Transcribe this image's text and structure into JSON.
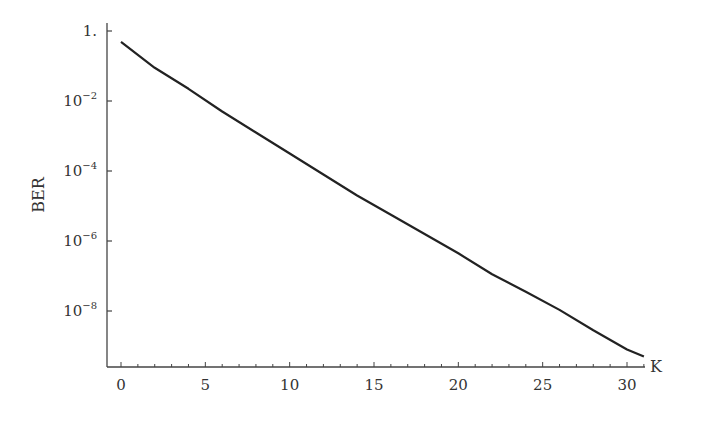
{
  "chart_data": {
    "type": "line",
    "title": "",
    "xlabel": "K",
    "ylabel": "BER",
    "yscale": "log",
    "xlim": [
      -0.8,
      31.8
    ],
    "ylim_log10": [
      -10.0,
      0.25
    ],
    "grid": false,
    "legend": null,
    "x_ticks": [
      0,
      5,
      10,
      15,
      20,
      25,
      30
    ],
    "x_minor_step": 1,
    "y_ticks": [
      {
        "log10": 0,
        "label": "1.",
        "exp": ""
      },
      {
        "log10": -2,
        "label": "10",
        "exp": "−2"
      },
      {
        "log10": -4,
        "label": "10",
        "exp": "−4"
      },
      {
        "log10": -6,
        "label": "10",
        "exp": "−6"
      },
      {
        "log10": -8,
        "label": "10",
        "exp": "−8"
      }
    ],
    "series": [
      {
        "name": "BER",
        "color": "#222222",
        "x": [
          0,
          2,
          4,
          6,
          8,
          10,
          12,
          14,
          16,
          18,
          20,
          22,
          24,
          26,
          28,
          30,
          31
        ],
        "log10_values": [
          -0.31,
          -1.05,
          -1.65,
          -2.3,
          -2.9,
          -3.5,
          -4.1,
          -4.7,
          -5.25,
          -5.8,
          -6.35,
          -6.95,
          -7.45,
          -7.97,
          -8.55,
          -9.1,
          -9.3
        ],
        "values": [
          0.49,
          0.089,
          0.022,
          0.005,
          0.0013,
          0.00032,
          7.9e-05,
          2e-05,
          5.6e-06,
          1.6e-06,
          4.5e-07,
          1.1e-07,
          3.5e-08,
          1.1e-08,
          2.8e-09,
          7.9e-10,
          5e-10
        ]
      }
    ]
  },
  "axes": {
    "x_label": "K",
    "y_label": "BER"
  }
}
